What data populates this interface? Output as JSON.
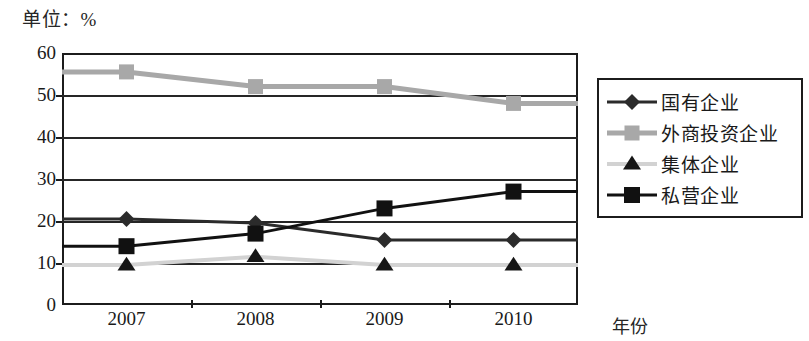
{
  "caption": "单位：%",
  "axis": {
    "x_title": "年份",
    "y_ticks": [
      "60",
      "50",
      "40",
      "30",
      "20",
      "10",
      "0"
    ],
    "x_ticks": [
      "2007",
      "2008",
      "2009",
      "2010"
    ]
  },
  "legend": {
    "items": [
      {
        "label": "国有企业",
        "marker": "diamond-marker",
        "color": "#2b2b2b"
      },
      {
        "label": "外商投资企业",
        "marker": "square-marker",
        "color": "#a8a8a8"
      },
      {
        "label": "集体企业",
        "marker": "triangle-marker",
        "color": "#d2d2d2"
      },
      {
        "label": "私营企业",
        "marker": "filled-square-marker",
        "color": "#111111"
      }
    ]
  },
  "chart_data": {
    "type": "line",
    "title": "单位：%",
    "xlabel": "年份",
    "ylabel": "",
    "categories": [
      "2007",
      "2008",
      "2009",
      "2010"
    ],
    "ylim": [
      0,
      60
    ],
    "ytick_step": 10,
    "grid": true,
    "legend_position": "right",
    "series": [
      {
        "name": "国有企业",
        "marker": "diamond",
        "color": "#2b2b2b",
        "values": [
          20.5,
          19.5,
          15.5,
          15.5
        ]
      },
      {
        "name": "外商投资企业",
        "marker": "square",
        "color": "#a8a8a8",
        "values": [
          55.5,
          52.0,
          52.0,
          48.0
        ]
      },
      {
        "name": "集体企业",
        "marker": "triangle",
        "color": "#d2d2d2",
        "values": [
          9.5,
          11.5,
          9.5,
          9.5
        ]
      },
      {
        "name": "私营企业",
        "marker": "filled-square",
        "color": "#111111",
        "values": [
          14.0,
          17.0,
          23.0,
          27.0
        ]
      }
    ]
  }
}
